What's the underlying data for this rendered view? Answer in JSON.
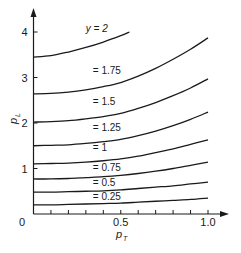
{
  "chart_data": {
    "type": "line",
    "title": "",
    "xlabel": "p_T",
    "ylabel": "p_L",
    "xlim": [
      0,
      1.0
    ],
    "ylim": [
      0,
      4.3
    ],
    "grid": false,
    "legend": "inline curve labels",
    "x_ticks": [
      0,
      0.1,
      0.2,
      0.3,
      0.4,
      0.5,
      0.6,
      0.7,
      0.8,
      0.9,
      1.0
    ],
    "x_tick_labels": [
      {
        "value": 0,
        "label": "0"
      },
      {
        "value": 0.5,
        "label": "0.5"
      },
      {
        "value": 1.0,
        "label": "1.0"
      }
    ],
    "y_tick_labels": [
      {
        "value": 1,
        "label": "1"
      },
      {
        "value": 2,
        "label": "2"
      },
      {
        "value": 3,
        "label": "3"
      },
      {
        "value": 4,
        "label": "4"
      }
    ],
    "series": [
      {
        "name": "y = 2",
        "label": "y = 2",
        "label_pos": [
          0.3,
          4.0
        ],
        "x": [
          0,
          0.1,
          0.2,
          0.3,
          0.4,
          0.5,
          0.55
        ],
        "values": [
          3.45,
          3.48,
          3.56,
          3.66,
          3.78,
          3.92,
          4.0
        ]
      },
      {
        "name": "y = 1.75",
        "label": "= 1.75",
        "label_pos": [
          0.34,
          3.08
        ],
        "x": [
          0,
          0.1,
          0.2,
          0.3,
          0.4,
          0.5,
          0.6,
          0.7,
          0.8,
          0.9,
          1.0
        ],
        "values": [
          2.64,
          2.65,
          2.68,
          2.73,
          2.8,
          2.89,
          3.03,
          3.2,
          3.4,
          3.62,
          3.87
        ]
      },
      {
        "name": "y = 1.5",
        "label": "= 1.5",
        "label_pos": [
          0.34,
          2.4
        ],
        "x": [
          0,
          0.1,
          0.2,
          0.3,
          0.4,
          0.5,
          0.6,
          0.7,
          0.8,
          0.9,
          1.0
        ],
        "values": [
          2.02,
          2.03,
          2.05,
          2.09,
          2.14,
          2.21,
          2.32,
          2.45,
          2.6,
          2.77,
          2.97
        ]
      },
      {
        "name": "y = 1.25",
        "label": "= 1.25",
        "label_pos": [
          0.34,
          1.82
        ],
        "x": [
          0,
          0.1,
          0.2,
          0.3,
          0.4,
          0.5,
          0.6,
          0.7,
          0.8,
          0.9,
          1.0
        ],
        "values": [
          1.5,
          1.51,
          1.52,
          1.55,
          1.59,
          1.64,
          1.72,
          1.82,
          1.94,
          2.08,
          2.24
        ]
      },
      {
        "name": "y = 1",
        "label": "= 1",
        "label_pos": [
          0.34,
          1.38
        ],
        "x": [
          0,
          0.1,
          0.2,
          0.3,
          0.4,
          0.5,
          0.6,
          0.7,
          0.8,
          0.9,
          1.0
        ],
        "values": [
          1.1,
          1.11,
          1.12,
          1.14,
          1.17,
          1.21,
          1.27,
          1.35,
          1.43,
          1.53,
          1.63
        ]
      },
      {
        "name": "y = 0.75",
        "label": "= 0.75",
        "label_pos": [
          0.34,
          0.95
        ],
        "x": [
          0,
          0.1,
          0.2,
          0.3,
          0.4,
          0.5,
          0.6,
          0.7,
          0.8,
          0.9,
          1.0
        ],
        "values": [
          0.77,
          0.77,
          0.78,
          0.8,
          0.82,
          0.85,
          0.89,
          0.94,
          1.0,
          1.07,
          1.14
        ]
      },
      {
        "name": "y = 0.5",
        "label": "= 0.5",
        "label_pos": [
          0.34,
          0.62
        ],
        "x": [
          0,
          0.1,
          0.2,
          0.3,
          0.4,
          0.5,
          0.6,
          0.7,
          0.8,
          0.9,
          1.0
        ],
        "values": [
          0.48,
          0.48,
          0.49,
          0.5,
          0.51,
          0.53,
          0.56,
          0.59,
          0.62,
          0.66,
          0.7
        ]
      },
      {
        "name": "y = 0.25",
        "label": "= 0.25",
        "label_pos": [
          0.34,
          0.3
        ],
        "x": [
          0,
          0.1,
          0.2,
          0.3,
          0.4,
          0.5,
          0.6,
          0.7,
          0.8,
          0.9,
          1.0
        ],
        "values": [
          0.2,
          0.2,
          0.21,
          0.22,
          0.23,
          0.24,
          0.26,
          0.28,
          0.3,
          0.32,
          0.35
        ]
      }
    ]
  },
  "axes": {
    "x_title": "p",
    "x_title_sub": "T",
    "y_title": "p",
    "y_title_sub": "L",
    "origin_label": "0"
  },
  "colors": {
    "line": "#1a1a1a",
    "background": "#ffffff"
  }
}
